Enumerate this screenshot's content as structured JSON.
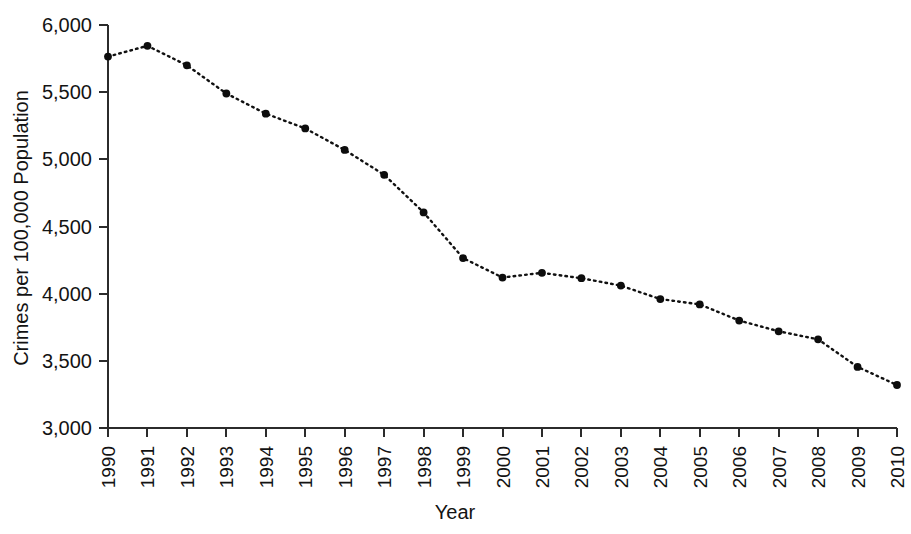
{
  "chart_data": {
    "type": "line",
    "title": "",
    "xlabel": "Year",
    "ylabel": "Crimes per 100,000 Population",
    "categories": [
      "1990",
      "1991",
      "1992",
      "1993",
      "1994",
      "1995",
      "1996",
      "1997",
      "1998",
      "1999",
      "2000",
      "2001",
      "2002",
      "2003",
      "2004",
      "2005",
      "2006",
      "2007",
      "2008",
      "2009",
      "2010"
    ],
    "x": [
      1990,
      1991,
      1992,
      1993,
      1994,
      1995,
      1996,
      1997,
      1998,
      1999,
      2000,
      2001,
      2002,
      2003,
      2004,
      2005,
      2006,
      2007,
      2008,
      2009,
      2010
    ],
    "values": [
      5765,
      5845,
      5700,
      5490,
      5340,
      5230,
      5070,
      4885,
      4605,
      4265,
      4120,
      4155,
      4115,
      4060,
      3960,
      3920,
      3800,
      3720,
      3660,
      3455,
      3320
    ],
    "series": [
      {
        "name": "Crime rate",
        "values": [
          5765,
          5845,
          5700,
          5490,
          5340,
          5230,
          5070,
          4885,
          4605,
          4265,
          4120,
          4155,
          4115,
          4060,
          3960,
          3920,
          3800,
          3720,
          3660,
          3455,
          3320
        ],
        "color": "#0d0d0d",
        "line_style": "dotted",
        "marker": "circle"
      }
    ],
    "ylim": [
      3000,
      6000
    ],
    "ytick_values": [
      3000,
      3500,
      4000,
      4500,
      5000,
      5500,
      6000
    ],
    "ytick_labels": [
      "3,000",
      "3,500",
      "4,000",
      "4,500",
      "5,000",
      "5,500",
      "6,000"
    ],
    "xlim": [
      1990,
      2010
    ],
    "grid": false,
    "legend": false,
    "legend_position": "none",
    "background_color": "#ffffff",
    "axis_color": "#2b2b2b"
  }
}
